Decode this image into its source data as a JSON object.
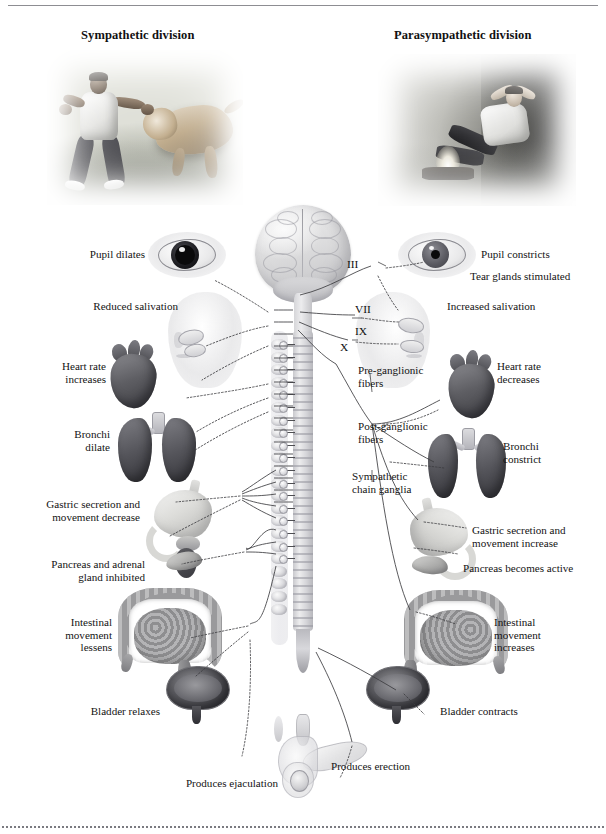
{
  "figure": {
    "left_division_title": "Sympathetic division",
    "right_division_title": "Parasympathetic division"
  },
  "photos": {
    "sympathetic": "man-confronting-tiger-photo",
    "parasympathetic": "man-relaxing-by-campfire-photo"
  },
  "cranial_nerves": [
    {
      "numeral": "III"
    },
    {
      "numeral": "VII"
    },
    {
      "numeral": "IX"
    },
    {
      "numeral": "X"
    }
  ],
  "center_labels": {
    "pre_ganglionic": "Pre-ganglionic\nfibers",
    "post_ganglionic": "Post-ganglionic\nfibers",
    "chain_ganglia": "Sympathetic\nchain ganglia"
  },
  "sympathetic_effects": [
    {
      "id": "pupil",
      "text": "Pupil dilates"
    },
    {
      "id": "salivation",
      "text": "Reduced salivation"
    },
    {
      "id": "heart",
      "text": "Heart rate\nincreases"
    },
    {
      "id": "bronchi",
      "text": "Bronchi\ndilate"
    },
    {
      "id": "stomach",
      "text": "Gastric secretion and\nmovement decrease"
    },
    {
      "id": "pancreas",
      "text": "Pancreas and adrenal\ngland inhibited"
    },
    {
      "id": "intestine",
      "text": "Intestinal\nmovement\nlessens"
    },
    {
      "id": "bladder",
      "text": "Bladder relaxes"
    },
    {
      "id": "genital",
      "text": "Produces ejaculation"
    }
  ],
  "parasympathetic_effects": [
    {
      "id": "pupil",
      "text": "Pupil constricts"
    },
    {
      "id": "tear",
      "text": "Tear glands stimulated"
    },
    {
      "id": "salivation",
      "text": "Increased salivation"
    },
    {
      "id": "heart",
      "text": "Heart rate\ndecreases"
    },
    {
      "id": "bronchi",
      "text": "Bronchi\nconstrict"
    },
    {
      "id": "stomach",
      "text": "Gastric secretion and\nmovement increase"
    },
    {
      "id": "pancreas",
      "text": "Pancreas becomes active"
    },
    {
      "id": "intestine",
      "text": "Intestinal\nmovement\nincreases"
    },
    {
      "id": "bladder",
      "text": "Bladder contracts"
    },
    {
      "id": "genital",
      "text": "Produces erection"
    }
  ],
  "colors": {
    "text": "#141414",
    "rule": "#8d8d92",
    "wire": "#3c3c40",
    "organ_dark": "#4a4a50",
    "organ_light": "#dcdcd9"
  }
}
